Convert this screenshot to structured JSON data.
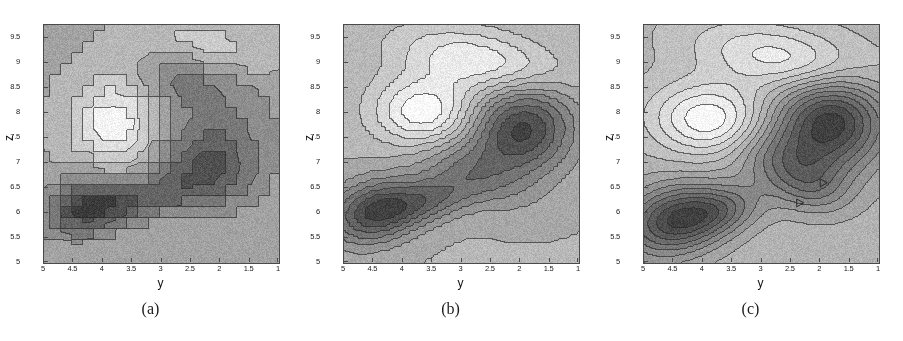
{
  "figure": {
    "background": "#ffffff",
    "panel_count": 3,
    "width": 903,
    "height": 341
  },
  "axes": {
    "xlabel": "y",
    "ylabel": "z",
    "xticks": [
      "5",
      "4.5",
      "4",
      "3.5",
      "3",
      "2.5",
      "2",
      "1.5",
      "1"
    ],
    "xtick_values": [
      5,
      4.5,
      4,
      3.5,
      3,
      2.5,
      2,
      1.5,
      1
    ],
    "yticks": [
      "5",
      "5.5",
      "6",
      "6.5",
      "7",
      "7.5",
      "8",
      "8.5",
      "9",
      "9.5"
    ],
    "ytick_values": [
      5,
      5.5,
      6,
      6.5,
      7,
      7.5,
      8,
      8.5,
      9,
      9.5
    ],
    "xlim": [
      5,
      1
    ],
    "ylim": [
      5,
      9.75
    ],
    "x_reversed": true,
    "grid": false
  },
  "colors": {
    "frame": "#4a4a4a",
    "contour_line": "#3a3a3a",
    "text": "#1a1a1a",
    "background_a": "#d6d6d6",
    "background_bc": "#f4f4f4",
    "peak_light": "#ffffff",
    "peak_dark": "#1c1c1c"
  },
  "panels": [
    {
      "id": "a",
      "caption": "(a)",
      "background_level": "#d6d6d6",
      "smoothing": "coarse",
      "description": "angular polygonal contours, coarse grid"
    },
    {
      "id": "b",
      "caption": "(b)",
      "background_level": "#f6f6f6",
      "smoothing": "medium",
      "description": "moderately smoothed contours, diagonal ridge"
    },
    {
      "id": "c",
      "caption": "(c)",
      "background_level": "#eeeeee",
      "smoothing": "fine",
      "description": "finely smoothed elliptical contours, dense nesting"
    }
  ],
  "chart_data": {
    "type": "heatmap",
    "title": "",
    "xlabel": "y",
    "ylabel": "z",
    "xlim": [
      5,
      1
    ],
    "ylim": [
      5,
      9.75
    ],
    "grid": false,
    "legend": "none",
    "colormap": "grayscale",
    "panels": [
      {
        "label": "(a)",
        "contour_levels": 10,
        "features": [
          {
            "name": "light-peak",
            "x": 3.75,
            "y": 7.8,
            "polarity": "high",
            "shape": "diamond"
          },
          {
            "name": "dark-peak-lower-left",
            "x": 4.25,
            "y": 6.15,
            "polarity": "low",
            "shape": "polygon"
          },
          {
            "name": "dark-peak-right",
            "x": 2.25,
            "y": 6.75,
            "polarity": "low",
            "shape": "small-triangle"
          },
          {
            "name": "dark-notch-upper",
            "x": 2.8,
            "y": 8.75,
            "polarity": "low",
            "shape": "small-triangle"
          },
          {
            "name": "light-lobe-upper-right",
            "x": 2.2,
            "y": 9.3,
            "polarity": "high",
            "shape": "polygon"
          }
        ]
      },
      {
        "label": "(b)",
        "contour_levels": 12,
        "features": [
          {
            "name": "light-peak",
            "x": 3.6,
            "y": 7.95,
            "polarity": "high",
            "shape": "ellipse"
          },
          {
            "name": "dark-peak-lower-left",
            "x": 4.5,
            "y": 6.0,
            "polarity": "low",
            "shape": "ellipse"
          },
          {
            "name": "dark-peak-upper-right",
            "x": 2.0,
            "y": 7.55,
            "polarity": "low",
            "shape": "ellipse"
          },
          {
            "name": "light-lobe-upper",
            "x": 2.6,
            "y": 9.1,
            "polarity": "high",
            "shape": "lobe"
          }
        ]
      },
      {
        "label": "(c)",
        "contour_levels": 14,
        "features": [
          {
            "name": "light-peak",
            "x": 3.85,
            "y": 7.85,
            "polarity": "high",
            "shape": "ellipse"
          },
          {
            "name": "dark-peak-lower-left",
            "x": 4.5,
            "y": 5.85,
            "polarity": "low",
            "shape": "ellipse"
          },
          {
            "name": "dark-peak-upper-right",
            "x": 1.85,
            "y": 7.75,
            "polarity": "low",
            "shape": "ellipse"
          },
          {
            "name": "light-lobe-upper",
            "x": 2.5,
            "y": 9.1,
            "polarity": "high",
            "shape": "lobe"
          },
          {
            "name": "marker-triangle-1",
            "x": 1.95,
            "y": 6.6,
            "polarity": "low",
            "shape": "tiny-triangle"
          },
          {
            "name": "marker-triangle-2",
            "x": 2.35,
            "y": 6.2,
            "polarity": "low",
            "shape": "tiny-triangle"
          }
        ]
      }
    ]
  }
}
